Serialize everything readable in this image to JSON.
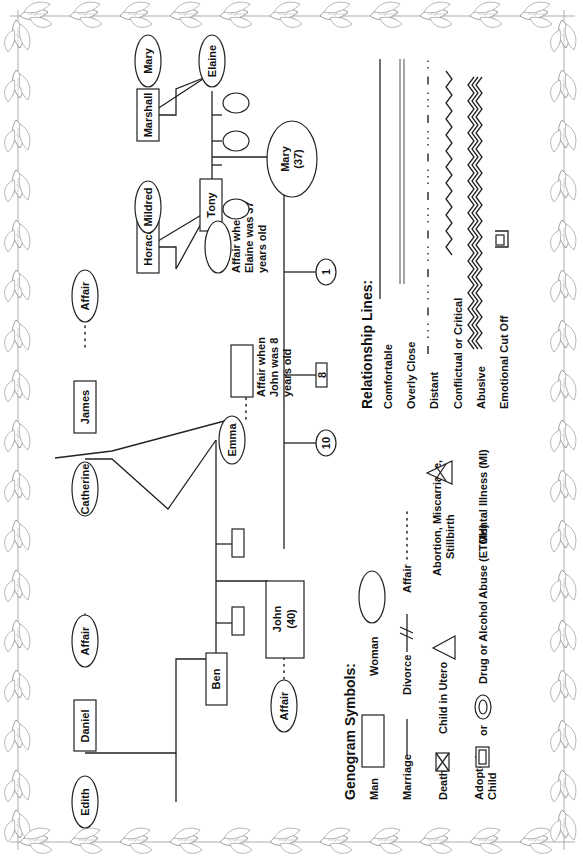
{
  "people": {
    "edith": "Edith",
    "daniel": "Daniel",
    "daniel_affair": "Affair",
    "ben": "Ben",
    "john": "John",
    "john_age": "(40)",
    "john_affair": "Affair",
    "emma": "Emma",
    "catherine": "Catherine",
    "james": "James",
    "james_affair": "Affair",
    "emma_affair_note": [
      "Affair when",
      "John was 8",
      "years old"
    ],
    "horace": "Horace",
    "mildred": "Mildred",
    "tony": "Tony",
    "tony_affair_note": [
      "Affair when",
      "Elaine was 37",
      "years old"
    ],
    "marshall": "Marshall",
    "mary_elder": "Mary",
    "elaine": "Elaine",
    "mary": "Mary",
    "mary_age": "(37)",
    "child_10": "10",
    "child_8": "8",
    "child_1": "1"
  },
  "legend_symbols": {
    "title": "Genogram Symbols:",
    "man": "Man",
    "woman": "Woman",
    "marriage": "Marriage",
    "divorce": "Divorce",
    "affair": "Affair",
    "death": "Death",
    "child_in_utero": "Child in Utero",
    "abortion": [
      "Abortion, Miscarriage,",
      "Stillbirth"
    ],
    "adopted_child": [
      "Adopted",
      "Child"
    ],
    "or": "or",
    "drug_alcohol": "Drug or Alcohol Abuse (ETOH)",
    "mental_illness": "Mental Illness (MI)"
  },
  "legend_relationships": {
    "title": "Relationship Lines:",
    "comfortable": "Comfortable",
    "overly_close": "Overly Close",
    "distant": "Distant",
    "conflictual": "Conflictual or Critical",
    "abusive": "Abusive",
    "cut_off": "Emotional Cut Off"
  },
  "colors": {
    "ink": "#222222",
    "border_ink": "#8a8a8a",
    "background": "#ffffff"
  }
}
